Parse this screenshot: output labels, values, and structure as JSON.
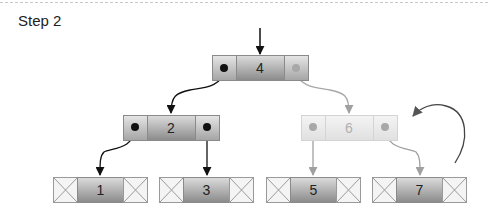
{
  "header": {
    "title": "Step 2"
  },
  "tree": {
    "root": {
      "value": "4",
      "faded_right_pointer": true
    },
    "level1": [
      {
        "value": "2",
        "faded": false
      },
      {
        "value": "6",
        "faded": true
      }
    ],
    "leaves": [
      {
        "value": "1",
        "faded": false
      },
      {
        "value": "3",
        "faded": false
      },
      {
        "value": "5",
        "faded": false
      },
      {
        "value": "7",
        "faded": false
      }
    ]
  },
  "annotations": {
    "rotation_arrow": "curved-arrow-counterclockwise"
  },
  "colors": {
    "node_dark": "#8e8e8e",
    "node_light": "#dcdcdc",
    "faded": "#a8a8a8",
    "edge": "#222222",
    "leaf_null": "#f4f4f4"
  }
}
